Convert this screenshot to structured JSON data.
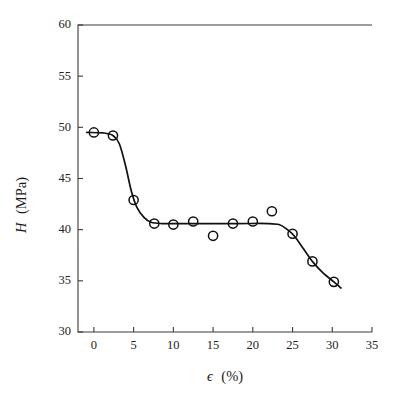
{
  "chart_data": {
    "type": "scatter",
    "title": "",
    "xlabel": "ϵ (%)",
    "ylabel": "H (MPa)",
    "xlabel_symbol": "ϵ",
    "xlabel_unit": "(%)",
    "ylabel_symbol": "H",
    "ylabel_unit": "(MPa)",
    "xlim": [
      -2,
      35
    ],
    "ylim": [
      30,
      60
    ],
    "xticks": [
      0,
      5,
      10,
      15,
      20,
      25,
      30,
      35
    ],
    "yticks": [
      30,
      35,
      40,
      45,
      50,
      55,
      60
    ],
    "xticklabels": [
      "0",
      "5",
      "10",
      "15",
      "20",
      "25",
      "30",
      "35"
    ],
    "yticklabels": [
      "30",
      "35",
      "40",
      "45",
      "50",
      "55",
      "60"
    ],
    "grid": false,
    "legend": "none",
    "marker_style": "open-circle",
    "points": [
      {
        "x": 0.0,
        "y": 49.5
      },
      {
        "x": 2.4,
        "y": 49.2
      },
      {
        "x": 5.0,
        "y": 42.9
      },
      {
        "x": 7.6,
        "y": 40.6
      },
      {
        "x": 10.0,
        "y": 40.5
      },
      {
        "x": 12.5,
        "y": 40.8
      },
      {
        "x": 15.0,
        "y": 39.4
      },
      {
        "x": 17.5,
        "y": 40.6
      },
      {
        "x": 20.0,
        "y": 40.8
      },
      {
        "x": 22.4,
        "y": 41.8
      },
      {
        "x": 25.0,
        "y": 39.6
      },
      {
        "x": 27.5,
        "y": 36.9
      },
      {
        "x": 30.2,
        "y": 34.9
      }
    ],
    "fit_curve": [
      {
        "x": -0.9,
        "y": 49.5
      },
      {
        "x": 1.2,
        "y": 49.45
      },
      {
        "x": 2.4,
        "y": 49.2
      },
      {
        "x": 3.2,
        "y": 48.4
      },
      {
        "x": 4.0,
        "y": 46.2
      },
      {
        "x": 4.7,
        "y": 43.8
      },
      {
        "x": 5.4,
        "y": 42.2
      },
      {
        "x": 6.3,
        "y": 41.2
      },
      {
        "x": 7.2,
        "y": 40.72
      },
      {
        "x": 8.5,
        "y": 40.6
      },
      {
        "x": 12.0,
        "y": 40.6
      },
      {
        "x": 18.0,
        "y": 40.6
      },
      {
        "x": 22.0,
        "y": 40.6
      },
      {
        "x": 23.3,
        "y": 40.5
      },
      {
        "x": 24.2,
        "y": 40.1
      },
      {
        "x": 25.2,
        "y": 39.4
      },
      {
        "x": 26.4,
        "y": 38.1
      },
      {
        "x": 27.6,
        "y": 36.8
      },
      {
        "x": 28.8,
        "y": 35.8
      },
      {
        "x": 30.2,
        "y": 34.9
      },
      {
        "x": 31.1,
        "y": 34.3
      }
    ],
    "colors": {
      "curve": "#111111",
      "marker_stroke": "#111111",
      "axis": "#3a3a3a",
      "background": "#ffffff",
      "text": "#222222"
    }
  },
  "figure": {
    "width": 404,
    "height": 404,
    "plot_area": {
      "left": 78,
      "right": 372,
      "top": 25,
      "bottom": 332
    }
  }
}
